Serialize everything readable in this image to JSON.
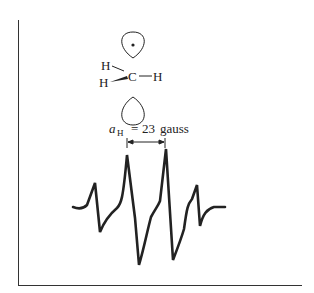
{
  "figure": {
    "molecule": {
      "name": "methyl radical",
      "center_atom": "C",
      "substituents": [
        "H",
        "H",
        "H"
      ],
      "orbital": "p-orbital with unpaired electron"
    },
    "annotation": {
      "symbol": "a",
      "subscript": "H",
      "equals": "=",
      "value": "23",
      "unit": "gauss"
    },
    "spectrum": {
      "type": "EPR first-derivative",
      "lines": 4,
      "intensity_ratio": "1:3:3:1"
    }
  }
}
